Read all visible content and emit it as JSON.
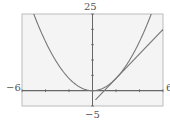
{
  "chart_data": {
    "type": "line",
    "title": "",
    "xlabel": "",
    "ylabel": "",
    "xlim": [
      -6,
      6
    ],
    "ylim": [
      -5,
      25
    ],
    "x_tick_step": 2,
    "y_tick_step": 5,
    "grid": false,
    "legend": null,
    "series": [
      {
        "name": "parabola",
        "expression": "y = x^2",
        "x": [
          -6,
          -5,
          -4,
          -3,
          -2,
          -1,
          0,
          1,
          2,
          3,
          4,
          5,
          6
        ],
        "values": [
          36,
          25,
          16,
          9,
          4,
          1,
          0,
          1,
          4,
          9,
          16,
          25,
          36
        ]
      },
      {
        "name": "tangent line at x=2",
        "expression": "y = 4x - 4",
        "x": [
          0.25,
          6
        ],
        "values": [
          -3,
          20
        ]
      }
    ],
    "axis_labels": {
      "y_max": "25",
      "y_min": "−5",
      "x_min": "−6",
      "x_max": "6"
    }
  },
  "colors": {
    "curve": "#777777",
    "axis": "#666666",
    "frame": "#bbbbbb",
    "background": "#f4f4f4"
  }
}
